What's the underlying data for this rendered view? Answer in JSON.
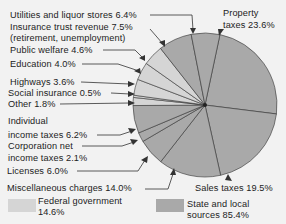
{
  "chart_data": {
    "type": "pie",
    "title": "",
    "colors": {
      "federal": "#d5d5d5",
      "state_local": "#a9a9a9",
      "background": "#f2f2f2",
      "line": "#333333"
    },
    "slices": [
      {
        "label": "Property taxes",
        "value": 23.6,
        "group": "state_local"
      },
      {
        "label": "Sales taxes",
        "value": 19.5,
        "group": "state_local"
      },
      {
        "label": "Miscellaneous charges",
        "value": 14.0,
        "group": "state_local"
      },
      {
        "label": "Licenses",
        "value": 6.0,
        "group": "state_local"
      },
      {
        "label": "Corporation net income taxes",
        "value": 2.1,
        "group": "state_local"
      },
      {
        "label": "Individual income taxes",
        "value": 6.2,
        "group": "state_local"
      },
      {
        "label": "Other",
        "value": 1.8,
        "group": "federal"
      },
      {
        "label": "Social insurance",
        "value": 0.5,
        "group": "federal"
      },
      {
        "label": "Highways",
        "value": 3.6,
        "group": "federal"
      },
      {
        "label": "Education",
        "value": 4.0,
        "group": "federal"
      },
      {
        "label": "Public welfare",
        "value": 4.6,
        "group": "federal"
      },
      {
        "label": "Insurance trust revenue (retirement, unemployment)",
        "value": 7.5,
        "group": "state_local"
      },
      {
        "label": "Utilities and liquor stores",
        "value": 6.4,
        "group": "state_local"
      }
    ],
    "legend": [
      {
        "label": "Federal government 14.6%",
        "value": 14.6
      },
      {
        "label": "State and local sources 85.4%",
        "value": 85.4
      }
    ]
  },
  "labels": {
    "utilities": "Utilities and liquor stores 6.4%",
    "insurance_1": "Insurance trust revenue 7.5%",
    "insurance_2": "(retirement, unemployment)",
    "welfare": "Public welfare 4.6%",
    "education": "Education 4.0%",
    "highways": "Highways 3.6%",
    "social": "Social insurance 0.5%",
    "other": "Other 1.8%",
    "individual_1": "Individual",
    "individual_2": "income taxes 6.2%",
    "corporation_1": "Corporation net",
    "corporation_2": "income taxes 2.1%",
    "licenses": "Licenses 6.0%",
    "misc": "Miscellaneous charges 14.0%",
    "property_1": "Property",
    "property_2": "taxes 23.6%",
    "sales": "Sales taxes 19.5%"
  },
  "legend": {
    "federal_1": "Federal government",
    "federal_2": "14.6%",
    "state_1": "State and local",
    "state_2": "sources 85.4%"
  }
}
